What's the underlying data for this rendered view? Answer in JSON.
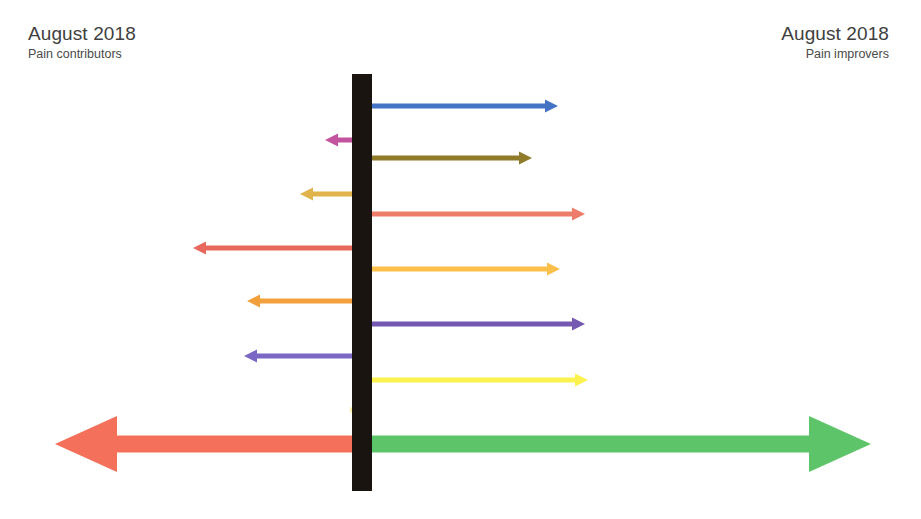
{
  "header": {
    "left": {
      "title": "August 2018",
      "subtitle": "Pain contributors"
    },
    "right": {
      "title": "August 2018",
      "subtitle": "Pain improvers"
    }
  },
  "center_bar": {
    "color": "#1a1411"
  },
  "chart_data": {
    "type": "bar",
    "xlabel": "",
    "ylabel": "",
    "orientation": "horizontal-diverging",
    "axis_origin_x": 362,
    "categories_left": [
      "Other conditions",
      "Anxiety",
      "Workload",
      "Maladaptive behaviours",
      "Poor sleep",
      "Beliefs – hidden disability"
    ],
    "categories_right": [
      "Physical activity",
      "Pain management",
      "Understand MSK condition",
      "Understand pain",
      "Physical adaptations",
      "Resilience"
    ],
    "series": [
      {
        "name": "Pain contributors (leftward magnitude)",
        "values": [
          37,
          62,
          169,
          115,
          118,
          12
        ]
      },
      {
        "name": "Pain improvers (rightward magnitude)",
        "values": [
          196,
          170,
          223,
          198,
          223,
          226
        ]
      }
    ],
    "legend": "none",
    "grid": false
  },
  "rows_right": [
    {
      "label": "Physical activity",
      "color": "#4472c4",
      "top": 96,
      "length": 196,
      "arrowhead": true
    },
    {
      "label": "Pain management",
      "color": "#8f7b2a",
      "top": 148,
      "length": 170,
      "arrowhead": true
    },
    {
      "label": "Understand MSK condition",
      "color": "#ed7d6a",
      "top": 204,
      "length": 223,
      "arrowhead": true
    },
    {
      "label": "Understand pain",
      "color": "#fbc04a",
      "top": 259,
      "length": 198,
      "arrowhead": true
    },
    {
      "label": "Physical adaptations",
      "color": "#7558b0",
      "top": 314,
      "length": 223,
      "arrowhead": true
    },
    {
      "label": "Resilience",
      "color": "#fcf24f",
      "top": 370,
      "length": 226,
      "arrowhead": true
    }
  ],
  "rows_left": [
    {
      "label": "Other conditions",
      "color": "#c4539f",
      "top": 130,
      "length": 37,
      "arrowhead": true
    },
    {
      "label": "Anxiety",
      "color": "#e0b44a",
      "top": 184,
      "length": 62,
      "arrowhead": true
    },
    {
      "label": "Workload",
      "color": "#e8685d",
      "top": 238,
      "length": 169,
      "arrowhead": true
    },
    {
      "label": "Maladaptive behaviours",
      "color": "#f2a03c",
      "top": 291,
      "length": 115,
      "arrowhead": true
    },
    {
      "label": "Poor sleep",
      "color": "#7b68c4",
      "top": 346,
      "length": 118,
      "arrowhead": true
    },
    {
      "label": "Beliefs – hidden disability",
      "color": "#fbf0a8",
      "top": 400,
      "length": 12,
      "arrowhead": false
    }
  ],
  "mega_arrows": {
    "left": {
      "name": "pain-contributors-mega-arrow",
      "color": "#f5705a",
      "length": 300,
      "direction": "left"
    },
    "right": {
      "name": "pain-improvers-mega-arrow",
      "color": "#5ec469",
      "length": 505,
      "direction": "right"
    }
  }
}
